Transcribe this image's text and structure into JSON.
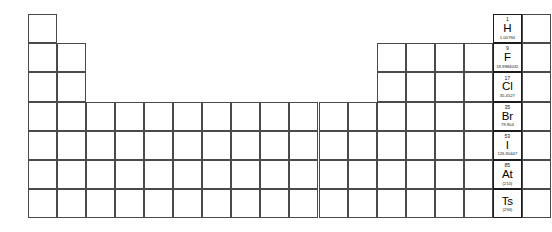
{
  "table": {
    "title": "Periodic Table of the Elements",
    "grid": {
      "columns": 18,
      "rows": 7,
      "origin_x": 28,
      "origin_y": 14,
      "cell_width": 29.05,
      "cell_height": 29.2
    },
    "colors": {
      "border": "#3a3a3a",
      "border_filled": "#1c1c1c",
      "background": "#ffffff",
      "text": "#000000"
    },
    "group_labels": [
      "1",
      "2",
      "3",
      "4",
      "5",
      "6",
      "7",
      "8",
      "9",
      "10",
      "11",
      "12",
      "13",
      "14",
      "15",
      "16",
      "17",
      "18"
    ],
    "period_labels": [
      "1",
      "2",
      "3",
      "4",
      "5",
      "6",
      "7"
    ],
    "highlighted_group": "17",
    "highlighted_group_name": "Halogens",
    "occupied_cells": [
      {
        "period": 1,
        "group": 1
      },
      {
        "period": 1,
        "group": 17
      },
      {
        "period": 1,
        "group": 18
      },
      {
        "period": 2,
        "group": 1
      },
      {
        "period": 2,
        "group": 2
      },
      {
        "period": 2,
        "group": 13
      },
      {
        "period": 2,
        "group": 14
      },
      {
        "period": 2,
        "group": 15
      },
      {
        "period": 2,
        "group": 16
      },
      {
        "period": 2,
        "group": 17
      },
      {
        "period": 2,
        "group": 18
      },
      {
        "period": 3,
        "group": 1
      },
      {
        "period": 3,
        "group": 2
      },
      {
        "period": 3,
        "group": 13
      },
      {
        "period": 3,
        "group": 14
      },
      {
        "period": 3,
        "group": 15
      },
      {
        "period": 3,
        "group": 16
      },
      {
        "period": 3,
        "group": 17
      },
      {
        "period": 3,
        "group": 18
      },
      {
        "period": 4,
        "group": 1
      },
      {
        "period": 4,
        "group": 2
      },
      {
        "period": 4,
        "group": 3
      },
      {
        "period": 4,
        "group": 4
      },
      {
        "period": 4,
        "group": 5
      },
      {
        "period": 4,
        "group": 6
      },
      {
        "period": 4,
        "group": 7
      },
      {
        "period": 4,
        "group": 8
      },
      {
        "period": 4,
        "group": 9
      },
      {
        "period": 4,
        "group": 10
      },
      {
        "period": 4,
        "group": 11
      },
      {
        "period": 4,
        "group": 12
      },
      {
        "period": 4,
        "group": 13
      },
      {
        "period": 4,
        "group": 14
      },
      {
        "period": 4,
        "group": 15
      },
      {
        "period": 4,
        "group": 16
      },
      {
        "period": 4,
        "group": 17
      },
      {
        "period": 4,
        "group": 18
      },
      {
        "period": 5,
        "group": 1
      },
      {
        "period": 5,
        "group": 2
      },
      {
        "period": 5,
        "group": 3
      },
      {
        "period": 5,
        "group": 4
      },
      {
        "period": 5,
        "group": 5
      },
      {
        "period": 5,
        "group": 6
      },
      {
        "period": 5,
        "group": 7
      },
      {
        "period": 5,
        "group": 8
      },
      {
        "period": 5,
        "group": 9
      },
      {
        "period": 5,
        "group": 10
      },
      {
        "period": 5,
        "group": 11
      },
      {
        "period": 5,
        "group": 12
      },
      {
        "period": 5,
        "group": 13
      },
      {
        "period": 5,
        "group": 14
      },
      {
        "period": 5,
        "group": 15
      },
      {
        "period": 5,
        "group": 16
      },
      {
        "period": 5,
        "group": 17
      },
      {
        "period": 5,
        "group": 18
      },
      {
        "period": 6,
        "group": 1
      },
      {
        "period": 6,
        "group": 2
      },
      {
        "period": 6,
        "group": 3
      },
      {
        "period": 6,
        "group": 4
      },
      {
        "period": 6,
        "group": 5
      },
      {
        "period": 6,
        "group": 6
      },
      {
        "period": 6,
        "group": 7
      },
      {
        "period": 6,
        "group": 8
      },
      {
        "period": 6,
        "group": 9
      },
      {
        "period": 6,
        "group": 10
      },
      {
        "period": 6,
        "group": 11
      },
      {
        "period": 6,
        "group": 12
      },
      {
        "period": 6,
        "group": 13
      },
      {
        "period": 6,
        "group": 14
      },
      {
        "period": 6,
        "group": 15
      },
      {
        "period": 6,
        "group": 16
      },
      {
        "period": 6,
        "group": 17
      },
      {
        "period": 6,
        "group": 18
      },
      {
        "period": 7,
        "group": 1
      },
      {
        "period": 7,
        "group": 2
      },
      {
        "period": 7,
        "group": 3
      },
      {
        "period": 7,
        "group": 4
      },
      {
        "period": 7,
        "group": 5
      },
      {
        "period": 7,
        "group": 6
      },
      {
        "period": 7,
        "group": 7
      },
      {
        "period": 7,
        "group": 8
      },
      {
        "period": 7,
        "group": 9
      },
      {
        "period": 7,
        "group": 10
      },
      {
        "period": 7,
        "group": 11
      },
      {
        "period": 7,
        "group": 12
      },
      {
        "period": 7,
        "group": 13
      },
      {
        "period": 7,
        "group": 14
      },
      {
        "period": 7,
        "group": 15
      },
      {
        "period": 7,
        "group": 16
      },
      {
        "period": 7,
        "group": 17
      },
      {
        "period": 7,
        "group": 18
      }
    ],
    "elements": [
      {
        "period": 1,
        "group": 17,
        "number": "1",
        "symbol": "H",
        "mass": "1.00794",
        "name": "hydrogen"
      },
      {
        "period": 2,
        "group": 17,
        "number": "9",
        "symbol": "F",
        "mass": "18.9984032",
        "name": "fluorine"
      },
      {
        "period": 3,
        "group": 17,
        "number": "17",
        "symbol": "Cl",
        "mass": "35.4527",
        "name": "chlorine"
      },
      {
        "period": 4,
        "group": 17,
        "number": "35",
        "symbol": "Br",
        "mass": "79.904",
        "name": "bromine"
      },
      {
        "period": 5,
        "group": 17,
        "number": "53",
        "symbol": "I",
        "mass": "126.90447",
        "name": "iodine"
      },
      {
        "period": 6,
        "group": 17,
        "number": "85",
        "symbol": "At",
        "mass": "(210)",
        "name": "astatine"
      },
      {
        "period": 7,
        "group": 17,
        "number": "",
        "symbol": "Ts",
        "mass": "(294)",
        "name": "tennessine"
      }
    ]
  }
}
